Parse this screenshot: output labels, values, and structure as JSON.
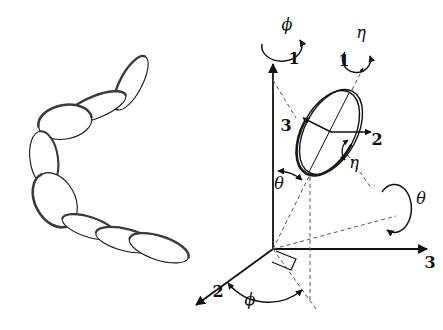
{
  "figure": {
    "background_color": "#ffffff",
    "ink_color": "#1a1a1a",
    "panels": [
      {
        "id": "chain",
        "name": "disc-chain-panel"
      },
      {
        "id": "frame",
        "name": "euler-angle-frame-panel"
      }
    ]
  },
  "chain_panel": {
    "name": "chain-of-discs",
    "description": "chain of linked ellipsoidal discs",
    "disc_count": 8,
    "discs": [
      {
        "index": 1,
        "cx": 131,
        "cy": 83,
        "rx": 30,
        "ry": 11,
        "rot": -62
      },
      {
        "index": 2,
        "cx": 96,
        "cy": 107,
        "rx": 32,
        "ry": 11,
        "rot": -22
      },
      {
        "index": 3,
        "cx": 65,
        "cy": 122,
        "rx": 27,
        "ry": 17,
        "rot": -10
      },
      {
        "index": 4,
        "cx": 44,
        "cy": 159,
        "rx": 28,
        "ry": 14,
        "rot": 82
      },
      {
        "index": 5,
        "cx": 55,
        "cy": 200,
        "rx": 29,
        "ry": 20,
        "rot": 62
      },
      {
        "index": 6,
        "cx": 89,
        "cy": 227,
        "rx": 28,
        "ry": 10,
        "rot": 18
      },
      {
        "index": 7,
        "cx": 126,
        "cy": 240,
        "rx": 31,
        "ry": 11,
        "rot": 14
      },
      {
        "index": 8,
        "cx": 159,
        "cy": 248,
        "rx": 31,
        "ry": 12,
        "rot": 18
      }
    ]
  },
  "frame_panel": {
    "name": "euler-frame",
    "origin": {
      "x": 273,
      "y": 249
    },
    "lab_axes": [
      {
        "id": "lab-1",
        "label": "1",
        "label_x": 294,
        "label_y": 64,
        "style": "solid",
        "direction": "up"
      },
      {
        "id": "lab-2",
        "label": "2",
        "label_x": 218,
        "label_y": 297,
        "style": "solid",
        "direction": "down-left"
      },
      {
        "id": "lab-3",
        "label": "3",
        "label_x": 430,
        "label_y": 268,
        "style": "solid",
        "direction": "right"
      }
    ],
    "body_axes": [
      {
        "id": "body-1",
        "label": "1",
        "label_x": 344,
        "label_y": 66,
        "style": "dashed",
        "direction": "up-right"
      },
      {
        "id": "body-2",
        "label": "2",
        "label_x": 377,
        "label_y": 145,
        "style": "solid",
        "direction": "right"
      },
      {
        "id": "body-3",
        "label": "3",
        "label_x": 286,
        "label_y": 131,
        "style": "solid",
        "direction": "up-left"
      }
    ],
    "angles": [
      {
        "id": "phi-spin",
        "symbol": "ϕ",
        "label_x": 287,
        "label_y": 30,
        "type": "rotation-arc",
        "about": "lab-1 axis"
      },
      {
        "id": "eta-spin",
        "symbol": "η",
        "label_x": 361,
        "label_y": 38,
        "type": "rotation-arc",
        "about": "body-1 axis"
      },
      {
        "id": "theta-tilt",
        "symbol": "θ",
        "label_x": 279,
        "label_y": 189,
        "type": "angle-arc",
        "between": "lab-1 and body-1"
      },
      {
        "id": "eta-angle",
        "symbol": "η",
        "label_x": 354,
        "label_y": 168,
        "type": "angle-arc",
        "between": "body-2 and node line"
      },
      {
        "id": "theta-spin",
        "symbol": "θ",
        "label_x": 421,
        "label_y": 204,
        "type": "rotation-arc",
        "about": "line of nodes"
      },
      {
        "id": "phi-angle",
        "symbol": "ϕ",
        "label_x": 250,
        "label_y": 305,
        "type": "angle-arc",
        "between": "lab-2 and node line"
      }
    ],
    "disc": {
      "name": "body-disc",
      "cx": 331,
      "cy": 132,
      "rx": 26,
      "ry": 46,
      "rot": 28
    },
    "right_angle_marker": {
      "x": 282,
      "y": 253,
      "name": "right-angle-marker"
    }
  }
}
